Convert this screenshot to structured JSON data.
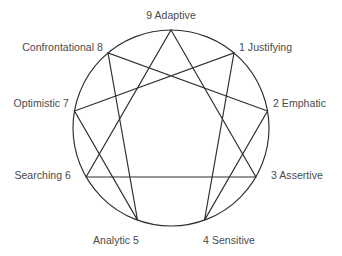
{
  "diagram": {
    "name": "Enneagram of Personality",
    "type": "enneagram",
    "background_color": "#ffffff",
    "stroke_color": "#2e2e2e",
    "text_color": "#4a4a4a",
    "circle": {
      "cx": 171,
      "cy": 128,
      "r": 98
    },
    "points": [
      {
        "number": "9",
        "trait": "Adaptive",
        "label": "9 Adaptive",
        "angle_deg": 0,
        "x": 171,
        "y": 30,
        "label_x": 171,
        "label_y": 15,
        "align": "center"
      },
      {
        "number": "1",
        "trait": "Justifying",
        "label": "1 Justifying",
        "angle_deg": 40,
        "x": 234.0,
        "y": 52.9,
        "label_x": 239,
        "label_y": 47,
        "align": "right"
      },
      {
        "number": "2",
        "trait": "Emphatic",
        "label": "2 Emphatic",
        "angle_deg": 80,
        "x": 267.5,
        "y": 111.0,
        "label_x": 273,
        "label_y": 103,
        "align": "right"
      },
      {
        "number": "3",
        "trait": "Assertive",
        "label": "3 Assertive",
        "angle_deg": 120,
        "x": 255.9,
        "y": 177.0,
        "label_x": 271,
        "label_y": 175,
        "align": "right"
      },
      {
        "number": "4",
        "trait": "Sensitive",
        "label": "4 Sensitive",
        "angle_deg": 160,
        "x": 204.5,
        "y": 220.1,
        "label_x": 229,
        "label_y": 240,
        "align": "center"
      },
      {
        "number": "5",
        "trait": "Analytic",
        "label": "Analytic 5",
        "angle_deg": 200,
        "x": 137.5,
        "y": 220.1,
        "label_x": 116,
        "label_y": 240,
        "align": "center"
      },
      {
        "number": "6",
        "trait": "Searching",
        "label": "Searching 6",
        "angle_deg": 240,
        "x": 86.1,
        "y": 177.0,
        "label_x": 71,
        "label_y": 175,
        "align": "left"
      },
      {
        "number": "7",
        "trait": "Optimistic",
        "label": "Optimistic 7",
        "angle_deg": 280,
        "x": 74.5,
        "y": 111.0,
        "label_x": 69,
        "label_y": 103,
        "align": "left"
      },
      {
        "number": "8",
        "trait": "Confrontational",
        "label": "Confrontational 8",
        "angle_deg": 320,
        "x": 108.0,
        "y": 52.9,
        "label_x": 103,
        "label_y": 47,
        "align": "left"
      }
    ],
    "triangle_path": "9-3-6-9",
    "hexad_path": "1-4-2-8-5-7-1",
    "line_groups": [
      {
        "name": "inner-triangle",
        "sequence": [
          "9",
          "3",
          "6"
        ]
      },
      {
        "name": "hexad",
        "sequence": [
          "1",
          "4",
          "2",
          "8",
          "5",
          "7"
        ]
      }
    ]
  }
}
